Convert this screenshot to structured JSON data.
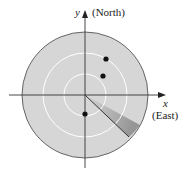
{
  "diagram": {
    "y_axis_label": "y",
    "y_axis_direction": "(North)",
    "x_axis_label": "x",
    "x_axis_direction": "(East)",
    "colors": {
      "disk_fill": "#d6d6d6",
      "ring_stroke": "#ffffff",
      "axis": "#333333",
      "point": "#111111",
      "sweep_dark": "#8a8a8a"
    },
    "rings": 3,
    "points": [
      {
        "x": 106,
        "y": 59
      },
      {
        "x": 103,
        "y": 76
      },
      {
        "x": 85,
        "y": 114
      }
    ]
  }
}
